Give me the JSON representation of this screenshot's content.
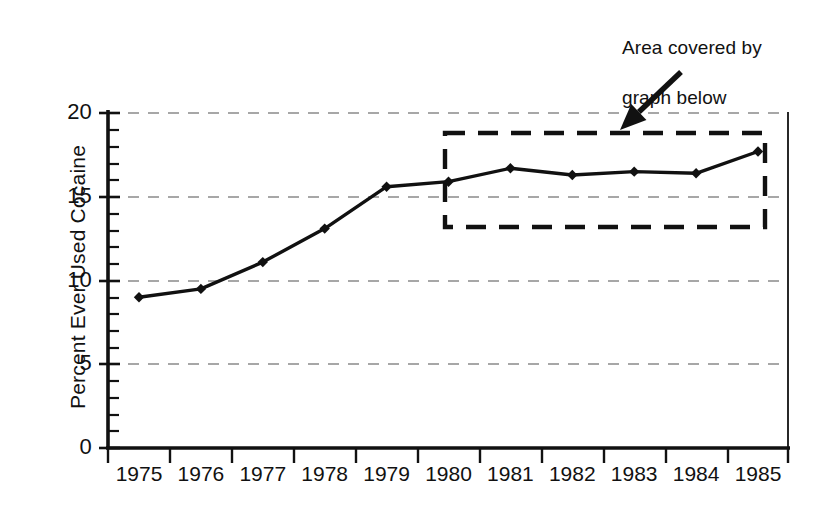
{
  "chart_data": {
    "type": "line",
    "title": "",
    "xlabel": "",
    "ylabel": "Percent Ever Used Cocaine",
    "categories": [
      "1975",
      "1976",
      "1977",
      "1978",
      "1979",
      "1980",
      "1981",
      "1982",
      "1983",
      "1984",
      "1985"
    ],
    "values": [
      9.0,
      9.5,
      11.1,
      13.1,
      15.6,
      15.9,
      16.7,
      16.3,
      16.5,
      16.4,
      17.7
    ],
    "series": [
      {
        "name": "Percent Ever Used Cocaine",
        "values": [
          9.0,
          9.5,
          11.1,
          13.1,
          15.6,
          15.9,
          16.7,
          16.3,
          16.5,
          16.4,
          17.7
        ]
      }
    ],
    "ylim": [
      0,
      20
    ],
    "ytick_labels": [
      "0",
      "5",
      "10",
      "15",
      "20"
    ],
    "ytick_values": [
      0,
      5,
      10,
      15,
      20
    ],
    "minor_ytick_step": 1,
    "grid": "horizontal-dashed-major",
    "legend": "none",
    "marker": "diamond",
    "line_color": "#111111",
    "grid_color": "#8a8a8a",
    "axis_color": "#111111"
  },
  "annotations": {
    "callout": {
      "text": "Area covered by\ngraph below",
      "line1": "Area covered by",
      "line2": "graph below",
      "arrow": {
        "from_x": 681,
        "from_y": 72,
        "to_x": 620,
        "to_y": 130
      }
    },
    "highlight_box": {
      "label": "dashed-highlight-rectangle",
      "x_start_year": "1980",
      "x_end_year": "1985",
      "y_min": 13.5,
      "y_max": 19.3,
      "style": "dashed"
    }
  },
  "axis_titles": {
    "y": "Percent Ever Used Cocaine"
  }
}
